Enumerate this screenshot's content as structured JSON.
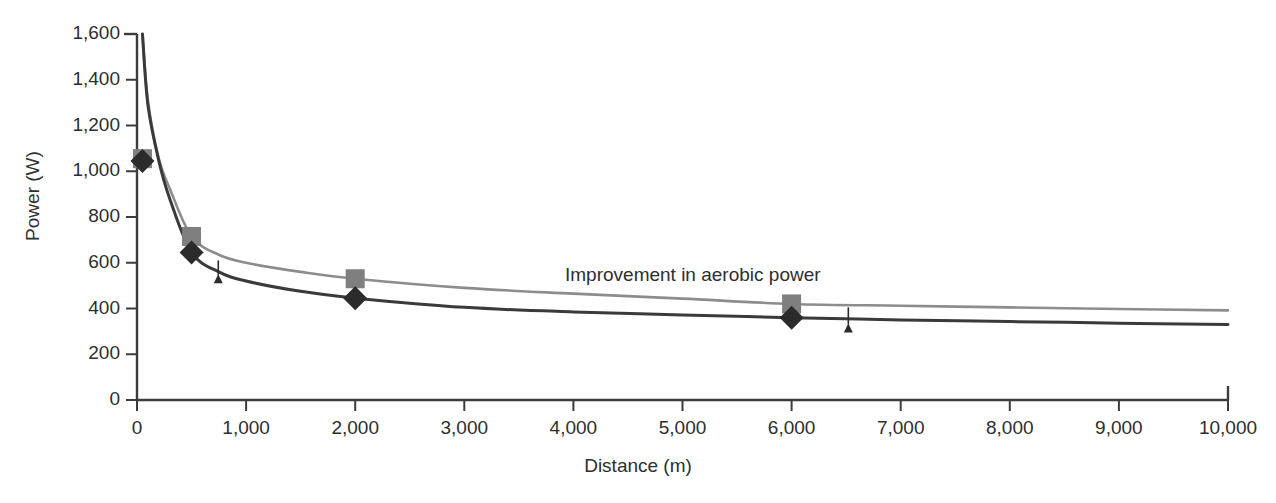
{
  "chart_data": {
    "type": "line",
    "title": "",
    "xlabel": "Distance (m)",
    "ylabel": "Power (W)",
    "xlim": [
      0,
      10000
    ],
    "ylim": [
      0,
      1600
    ],
    "grid": false,
    "legend_position": "none",
    "x_ticks": [
      0,
      1000,
      2000,
      3000,
      4000,
      5000,
      6000,
      7000,
      8000,
      9000,
      10000
    ],
    "x_tick_labels": [
      "0",
      "1,000",
      "2,000",
      "3,000",
      "4,000",
      "5,000",
      "6,000",
      "7,000",
      "8,000",
      "9,000",
      "10,000"
    ],
    "y_ticks": [
      0,
      200,
      400,
      600,
      800,
      1000,
      1200,
      1400,
      1600
    ],
    "y_tick_labels": [
      "0",
      "200",
      "400",
      "600",
      "800",
      "1,000",
      "1,200",
      "1,400",
      "1,600"
    ],
    "series": [
      {
        "name": "After training (improved aerobic power)",
        "color": "#8c8c8c",
        "marker": "square",
        "marker_color": "#7f7f7f",
        "x": [
          50,
          100,
          200,
          300,
          500,
          750,
          1000,
          1500,
          2000,
          3000,
          4000,
          5000,
          6000,
          7000,
          8000,
          9000,
          10000
        ],
        "y": [
          1600,
          1310,
          1055,
          925,
          715,
          635,
          600,
          560,
          530,
          490,
          465,
          443,
          420,
          412,
          405,
          398,
          392
        ],
        "marker_points": [
          {
            "x": 50,
            "y": 1055
          },
          {
            "x": 500,
            "y": 715
          },
          {
            "x": 2000,
            "y": 530
          },
          {
            "x": 6000,
            "y": 420
          }
        ]
      },
      {
        "name": "Before training",
        "color": "#3a3a3a",
        "marker": "diamond",
        "marker_color": "#2b2b2b",
        "x": [
          50,
          100,
          200,
          300,
          500,
          750,
          1000,
          1500,
          2000,
          3000,
          4000,
          5000,
          6000,
          7000,
          8000,
          9000,
          10000
        ],
        "y": [
          1600,
          1290,
          1045,
          880,
          645,
          560,
          520,
          475,
          445,
          405,
          385,
          372,
          360,
          350,
          343,
          336,
          330
        ],
        "marker_points": [
          {
            "x": 50,
            "y": 1045
          },
          {
            "x": 500,
            "y": 645
          },
          {
            "x": 2000,
            "y": 445
          },
          {
            "x": 6000,
            "y": 360
          }
        ]
      }
    ],
    "annotations": [
      {
        "text": "Improvement in aerobic power",
        "x": 4430,
        "y": 565,
        "kind": "label"
      },
      {
        "kind": "arrow",
        "x": 745,
        "y_from": 545,
        "y_to": 610
      },
      {
        "kind": "arrow",
        "x": 6520,
        "y_from": 330,
        "y_to": 405
      }
    ]
  },
  "axes": {
    "x_title": "Distance (m)",
    "y_title": "Power (W)"
  },
  "annotation_text": {
    "improvement": "Improvement in aerobic power"
  },
  "colors": {
    "series_after": "#8c8c8c",
    "series_before": "#3a3a3a",
    "axis": "#3c3c3c",
    "text": "#2e2e2e",
    "background": "#ffffff"
  }
}
